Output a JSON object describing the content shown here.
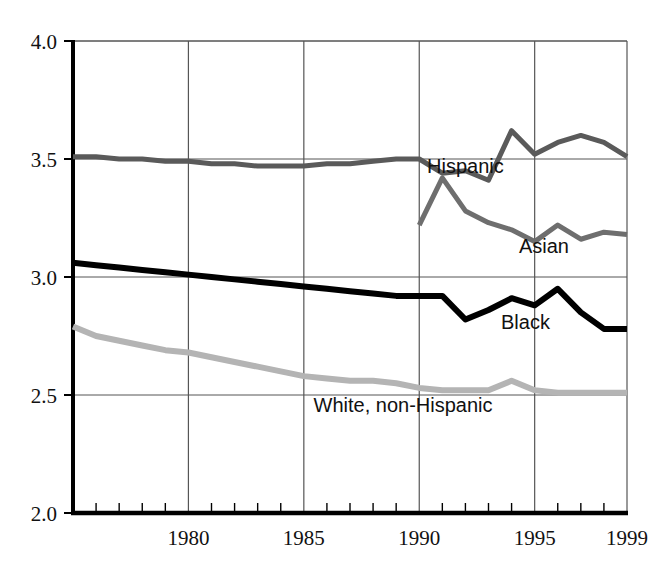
{
  "chart_data": {
    "type": "line",
    "title": "",
    "subtitle": "",
    "xlabel": "",
    "ylabel": "",
    "xlim": [
      1975,
      1999
    ],
    "ylim": [
      2.0,
      4.0
    ],
    "grid": true,
    "grid_x_values": [
      1980,
      1985,
      1990,
      1995
    ],
    "grid_y_values": [
      2.5,
      3.0,
      3.5,
      4.0
    ],
    "legend_position": "inline-right",
    "y_ticks": [
      "2.0",
      "2.5",
      "3.0",
      "3.5",
      "4.0"
    ],
    "y_tick_values": [
      2.0,
      2.5,
      3.0,
      3.5,
      4.0
    ],
    "x_ticks": [
      "1980",
      "1985",
      "1990",
      "1995",
      "1999"
    ],
    "x_tick_values": [
      1980,
      1985,
      1990,
      1995,
      1999
    ],
    "x_minor_tick_step": 1,
    "series": [
      {
        "name": "Hispanic",
        "color": "#5a5a5a",
        "width": 5,
        "label_x": 1992.0,
        "label_y": 3.44,
        "x": [
          1975,
          1976,
          1977,
          1978,
          1979,
          1980,
          1981,
          1982,
          1983,
          1984,
          1985,
          1986,
          1987,
          1988,
          1989,
          1990,
          1991,
          1992,
          1993,
          1994,
          1995,
          1996,
          1997,
          1998,
          1999
        ],
        "values": [
          3.51,
          3.51,
          3.5,
          3.5,
          3.49,
          3.49,
          3.48,
          3.48,
          3.47,
          3.47,
          3.47,
          3.48,
          3.48,
          3.49,
          3.5,
          3.5,
          3.44,
          3.45,
          3.41,
          3.62,
          3.52,
          3.57,
          3.6,
          3.57,
          3.51
        ]
      },
      {
        "name": "Asian",
        "color": "#6e6e6e",
        "width": 5,
        "label_x": 1995.4,
        "label_y": 3.1,
        "x": [
          1990,
          1991,
          1992,
          1993,
          1994,
          1995,
          1996,
          1997,
          1998,
          1999
        ],
        "values": [
          3.22,
          3.42,
          3.28,
          3.23,
          3.2,
          3.15,
          3.22,
          3.16,
          3.19,
          3.18
        ]
      },
      {
        "name": "Black",
        "color": "#000000",
        "width": 6,
        "label_x": 1994.6,
        "label_y": 2.78,
        "x": [
          1975,
          1976,
          1977,
          1978,
          1979,
          1980,
          1981,
          1982,
          1983,
          1984,
          1985,
          1986,
          1987,
          1988,
          1989,
          1990,
          1991,
          1992,
          1993,
          1994,
          1995,
          1996,
          1997,
          1998,
          1999
        ],
        "values": [
          3.06,
          3.05,
          3.04,
          3.03,
          3.02,
          3.01,
          3.0,
          2.99,
          2.98,
          2.97,
          2.96,
          2.95,
          2.94,
          2.93,
          2.92,
          2.92,
          2.92,
          2.82,
          2.86,
          2.91,
          2.88,
          2.95,
          2.85,
          2.78,
          2.78
        ]
      },
      {
        "name": "White, non-Hispanic",
        "color": "#b4b4b4",
        "width": 6,
        "label_x": 1989.3,
        "label_y": 2.43,
        "x": [
          1975,
          1976,
          1977,
          1978,
          1979,
          1980,
          1981,
          1982,
          1983,
          1984,
          1985,
          1986,
          1987,
          1988,
          1989,
          1990,
          1991,
          1992,
          1993,
          1994,
          1995,
          1996,
          1997,
          1998,
          1999
        ],
        "values": [
          2.79,
          2.75,
          2.73,
          2.71,
          2.69,
          2.68,
          2.66,
          2.64,
          2.62,
          2.6,
          2.58,
          2.57,
          2.56,
          2.56,
          2.55,
          2.53,
          2.52,
          2.52,
          2.52,
          2.56,
          2.52,
          2.51,
          2.51,
          2.51,
          2.51
        ]
      }
    ]
  },
  "axes": {
    "frame_color": "#000000",
    "grid_color": "#555555",
    "background": "#ffffff"
  }
}
